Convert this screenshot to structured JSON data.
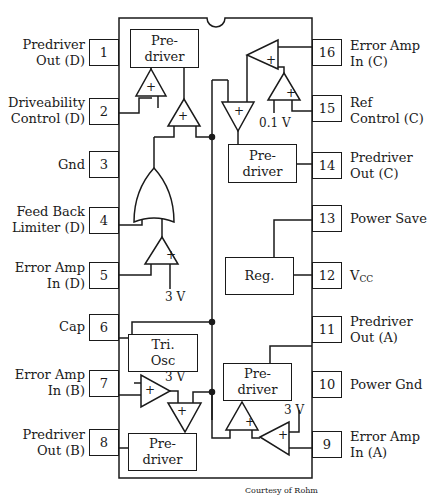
{
  "diagram": {
    "type": "ic-pinout-block-diagram",
    "credit": "Courtesy of Rohm",
    "left_pins": [
      {
        "num": "1",
        "line1": "Predriver",
        "line2": "Out (D)"
      },
      {
        "num": "2",
        "line1": "Driveability",
        "line2": "Control (D)"
      },
      {
        "num": "3",
        "line1": "Gnd",
        "line2": ""
      },
      {
        "num": "4",
        "line1": "Feed Back",
        "line2": "Limiter (D)"
      },
      {
        "num": "5",
        "line1": "Error Amp",
        "line2": "In (D)"
      },
      {
        "num": "6",
        "line1": "Cap",
        "line2": ""
      },
      {
        "num": "7",
        "line1": "Error Amp",
        "line2": "In (B)"
      },
      {
        "num": "8",
        "line1": "Predriver",
        "line2": "Out (B)"
      }
    ],
    "right_pins": [
      {
        "num": "16",
        "line1": "Error Amp",
        "line2": "In (C)"
      },
      {
        "num": "15",
        "line1": "Ref",
        "line2": "Control (C)"
      },
      {
        "num": "14",
        "line1": "Predriver",
        "line2": "Out (C)"
      },
      {
        "num": "13",
        "line1": "Power Save",
        "line2": ""
      },
      {
        "num": "12",
        "line1": "V",
        "sub": "CC"
      },
      {
        "num": "11",
        "line1": "Predriver",
        "line2": "Out (A)"
      },
      {
        "num": "10",
        "line1": "Power Gnd",
        "line2": ""
      },
      {
        "num": "9",
        "line1": "Error Amp",
        "line2": "In (A)"
      }
    ],
    "blocks": {
      "predriver_d": {
        "line1": "Pre-",
        "line2": "driver"
      },
      "predriver_c": {
        "line1": "Pre-",
        "line2": "driver"
      },
      "predriver_a": {
        "line1": "Pre-",
        "line2": "driver"
      },
      "predriver_b": {
        "line1": "Pre-",
        "line2": "driver"
      },
      "regulator": {
        "label": "Reg."
      },
      "tri_osc": {
        "line1": "Tri.",
        "line2": "Osc"
      }
    },
    "voltages": {
      "ref_c": "0.1 V",
      "ref_d": "3 V",
      "ref_b": "3 V",
      "ref_a": "3 V"
    },
    "amp_sign": "+"
  }
}
